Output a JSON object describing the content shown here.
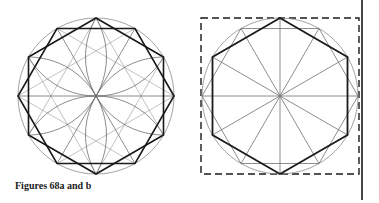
{
  "caption": "Figures 68a and b",
  "colors": {
    "ink": "#1a1a1a",
    "thin": "#6e6e6e",
    "circle": "#8a8a8a",
    "background": "#ffffff"
  },
  "figures": [
    {
      "id": "68a",
      "center": [
        96,
        96
      ],
      "radius": 78,
      "elements": [
        "circumscribed-circle",
        "hexagon-pointy-top",
        "hexagon-flat-top",
        "six-petal-rosette-arcs",
        "radial-lines"
      ]
    },
    {
      "id": "68b",
      "center": [
        280,
        96
      ],
      "radius": 78,
      "elements": [
        "dashed-bounding-square",
        "circumscribed-circle",
        "hexagon-pointy-top-bold",
        "hexagon-flat-top-thin",
        "twelve-radial-lines"
      ]
    }
  ],
  "page_rule": {
    "x": 362,
    "y1": 0,
    "y2": 200
  }
}
